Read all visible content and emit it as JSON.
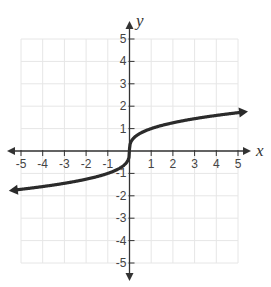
{
  "chart_data": {
    "type": "line",
    "title": "",
    "function": "y = cube_root(x)",
    "xlabel": "x",
    "ylabel": "y",
    "xlim": [
      -5,
      5
    ],
    "ylim": [
      -5,
      5
    ],
    "grid": true,
    "legend": null,
    "x_ticks": [
      -5,
      -4,
      -3,
      -2,
      -1,
      1,
      2,
      3,
      4,
      5
    ],
    "y_ticks": [
      -5,
      -4,
      -3,
      -2,
      -1,
      1,
      2,
      3,
      4,
      5
    ],
    "x_tick_labels": [
      "-5",
      "-4",
      "-3",
      "-2",
      "-1",
      "1",
      "2",
      "3",
      "4",
      "5"
    ],
    "y_tick_labels": [
      "-5",
      "-4",
      "-3",
      "-2",
      "-1",
      "1",
      "2",
      "3",
      "4",
      "5"
    ],
    "series": [
      {
        "name": "cube root curve",
        "arrows": "both ends",
        "x": [
          -5.2,
          -5,
          -4,
          -3,
          -2,
          -1,
          -0.5,
          -0.125,
          0,
          0.125,
          0.5,
          1,
          2,
          3,
          4,
          5,
          5.2
        ],
        "y": [
          -1.73,
          -1.71,
          -1.59,
          -1.44,
          -1.26,
          -1.0,
          -0.79,
          -0.5,
          0,
          0.5,
          0.79,
          1.0,
          1.26,
          1.44,
          1.59,
          1.71,
          1.73
        ]
      }
    ]
  },
  "colors": {
    "grid": "#e6e6e6",
    "axis": "#333333",
    "curve": "#2b2b2b",
    "labels": "#444444"
  }
}
